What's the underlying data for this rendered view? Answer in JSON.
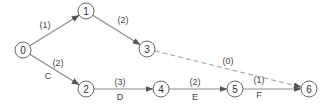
{
  "diagram": {
    "type": "activity-network",
    "nodes": [
      {
        "id": "0",
        "label": "0",
        "x": 23,
        "y": 50
      },
      {
        "id": "1",
        "label": "1",
        "x": 86,
        "y": 11
      },
      {
        "id": "2",
        "label": "2",
        "x": 86,
        "y": 89
      },
      {
        "id": "3",
        "label": "3",
        "x": 147,
        "y": 49
      },
      {
        "id": "4",
        "label": "4",
        "x": 161,
        "y": 89
      },
      {
        "id": "5",
        "label": "5",
        "x": 235,
        "y": 89
      },
      {
        "id": "6",
        "label": "6",
        "x": 309,
        "y": 89
      }
    ],
    "edges": [
      {
        "from": "0",
        "to": "1",
        "duration": "(1)",
        "activity": "",
        "dashed": false,
        "dur_pos": [
          45,
          25
        ],
        "act_pos": null
      },
      {
        "from": "1",
        "to": "3",
        "duration": "(2)",
        "activity": "",
        "dashed": false,
        "dur_pos": [
          123,
          20
        ],
        "act_pos": null
      },
      {
        "from": "0",
        "to": "2",
        "duration": "(2)",
        "activity": "C",
        "dashed": false,
        "dur_pos": [
          58,
          63
        ],
        "act_pos": [
          48,
          76
        ]
      },
      {
        "from": "2",
        "to": "4",
        "duration": "(3)",
        "activity": "D",
        "dashed": false,
        "dur_pos": [
          120,
          82
        ],
        "act_pos": [
          120,
          97
        ]
      },
      {
        "from": "4",
        "to": "5",
        "duration": "(2)",
        "activity": "E",
        "dashed": false,
        "dur_pos": [
          195,
          82
        ],
        "act_pos": [
          195,
          97
        ]
      },
      {
        "from": "5",
        "to": "6",
        "duration": "(1)",
        "activity": "F",
        "dashed": false,
        "dur_pos": [
          259,
          80
        ],
        "act_pos": [
          259,
          95
        ]
      },
      {
        "from": "3",
        "to": "6",
        "duration": "(0)",
        "activity": "",
        "dashed": true,
        "dur_pos": [
          228,
          61
        ],
        "act_pos": null
      }
    ],
    "colors": {
      "node_stroke": "#6a6a6a",
      "edge": "#8a8a8a",
      "text": "#333333"
    }
  }
}
